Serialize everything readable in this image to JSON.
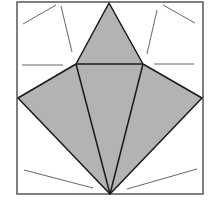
{
  "diagram": {
    "type": "geometric-figure",
    "colors": {
      "background": "#ffffff",
      "border": "#555555",
      "fill": "#b3b3b3",
      "edge": "#1a1a1a",
      "guide": "#555555"
    },
    "square": {
      "x1": 17,
      "y1": 2,
      "x2": 203,
      "y2": 194
    },
    "vertices": {
      "top": [
        109,
        3
      ],
      "upper_left": [
        76,
        64
      ],
      "upper_right": [
        143,
        64
      ],
      "left": [
        18,
        98
      ],
      "right": [
        202,
        98
      ],
      "bottom": [
        110,
        194
      ]
    },
    "shaded_polygon": "109,3 143,64 202,98 110,194 18,98 76,64",
    "edges": [
      [
        76,
        64,
        143,
        64
      ],
      [
        76,
        64,
        110,
        194
      ],
      [
        143,
        64,
        110,
        194
      ]
    ],
    "guide_lines": [
      [
        23,
        24,
        56,
        5
      ],
      [
        61,
        6,
        72,
        52
      ],
      [
        22,
        65,
        63,
        65
      ],
      [
        163,
        5,
        195,
        23
      ],
      [
        157,
        10,
        147,
        54
      ],
      [
        154,
        64,
        194,
        64
      ],
      [
        24,
        170,
        93,
        188
      ],
      [
        127,
        189,
        197,
        169
      ]
    ]
  }
}
